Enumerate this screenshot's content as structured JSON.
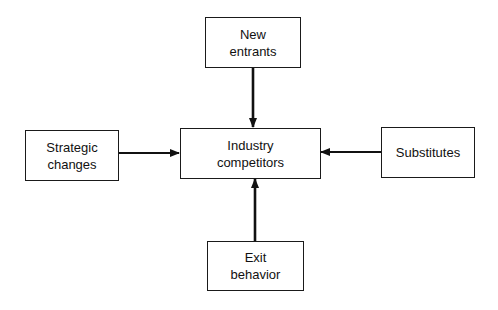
{
  "diagram": {
    "nodes": {
      "new_entrants": {
        "line1": "New",
        "line2": "entrants"
      },
      "industry": {
        "line1": "Industry",
        "line2": "competitors"
      },
      "strategic": {
        "line1": "Strategic",
        "line2": "changes"
      },
      "substitutes": {
        "line1": "Substitutes"
      },
      "exit": {
        "line1": "Exit",
        "line2": "behavior"
      }
    },
    "edges": [
      {
        "from": "New entrants",
        "to": "Industry competitors"
      },
      {
        "from": "Strategic changes",
        "to": "Industry competitors"
      },
      {
        "from": "Substitutes",
        "to": "Industry competitors"
      },
      {
        "from": "Exit behavior",
        "to": "Industry competitors"
      }
    ]
  }
}
